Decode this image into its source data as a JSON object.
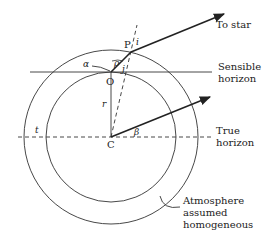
{
  "diagram": {
    "labels": {
      "to_star": "To star",
      "sensible_horizon_1": "Sensible",
      "sensible_horizon_2": "horizon",
      "true_horizon_1": "True",
      "true_horizon_2": "horizon",
      "atmosphere_1": "Atmosphere",
      "atmosphere_2": "assumed",
      "atmosphere_3": "homogeneous"
    },
    "points": {
      "P": "P",
      "O": "O",
      "C": "C"
    },
    "symbols": {
      "alpha": "α",
      "beta": "β",
      "rho": "ρ",
      "i": "i",
      "j": "j",
      "r": "r",
      "t": "t"
    },
    "colors": {
      "line": "#222222",
      "background": "#ffffff"
    }
  }
}
